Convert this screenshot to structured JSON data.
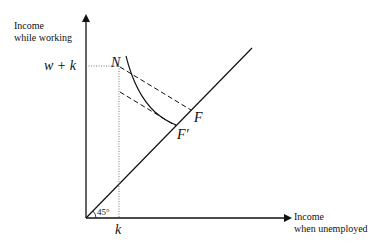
{
  "diagram": {
    "y_axis_label_line1": "Income",
    "y_axis_label_line2": "while working",
    "x_axis_label_line1": "Income",
    "x_axis_label_line2": "when unemployed",
    "y_tick_label": "w + k",
    "x_tick_label": "k",
    "angle_label": "45°",
    "point_N": "N",
    "point_F": "F",
    "point_F_prime": "F′",
    "colors": {
      "line": "#111111",
      "dotted": "#777777",
      "background": "#ffffff"
    }
  }
}
